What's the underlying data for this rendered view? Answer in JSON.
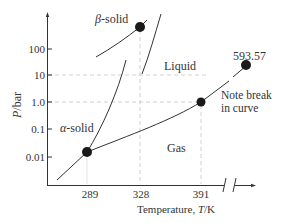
{
  "diagram": {
    "type": "phase-diagram",
    "y_axis": {
      "label_italic": "P",
      "label_unit": "/bar",
      "scale": "log",
      "ticks": [
        {
          "label": "100",
          "value": 100
        },
        {
          "label": "10",
          "value": 10
        },
        {
          "label": "1.0",
          "value": 1.0
        },
        {
          "label": "0.1",
          "value": 0.1
        },
        {
          "label": "0.01",
          "value": 0.01
        }
      ]
    },
    "x_axis": {
      "label_prefix": "Temperature, ",
      "label_italic": "T",
      "label_unit": "/K",
      "ticks": [
        {
          "label": "289",
          "value": 289
        },
        {
          "label": "328",
          "value": 328
        },
        {
          "label": "391",
          "value": 391
        }
      ],
      "has_break": true
    },
    "regions": {
      "beta_solid": {
        "greek": "β",
        "text": "-solid"
      },
      "alpha_solid": {
        "greek": "α",
        "text": "-solid"
      },
      "liquid": "Liquid",
      "gas": "Gas"
    },
    "points": [
      {
        "name": "triple-point-alpha-liquid-gas",
        "T": 289
      },
      {
        "name": "triple-point-beta",
        "T": 328
      },
      {
        "name": "point-391",
        "T": 391,
        "P": 1.0
      },
      {
        "name": "critical-point",
        "T": 593.57,
        "label": "593.57"
      }
    ],
    "annotation": {
      "line1": "Note break",
      "line2": "in curve"
    },
    "dashed_guides": [
      "P=10",
      "P=1.0",
      "T=328",
      "T=391"
    ],
    "colors": {
      "line": "#333333",
      "dash": "#bbbbbb",
      "point": "#1a1a1a"
    }
  }
}
